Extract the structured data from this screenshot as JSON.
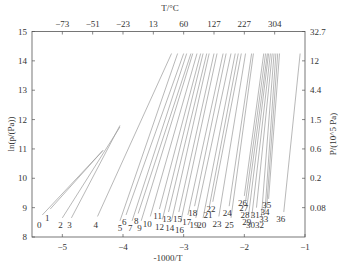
{
  "chart_data": {
    "type": "line",
    "title": "",
    "xlabel": "-1000/T",
    "ylabel": "ln(p/(Pa))",
    "top_xlabel": "T/°C",
    "right_ylabel": "P/(10^5 Pa)",
    "xlim": [
      -5.5,
      -1
    ],
    "ylim": [
      8,
      15
    ],
    "grid": false,
    "legend": "none (series labeled 0–36 at lower ends)",
    "x_ticks": [
      -5,
      -4,
      -3,
      -2,
      -1
    ],
    "x_tick_labels": [
      "−5",
      "−4",
      "−3",
      "−2",
      "−1"
    ],
    "y_ticks": [
      8,
      9,
      10,
      11,
      12,
      13,
      14,
      15
    ],
    "y_tick_labels": [
      "8",
      "9",
      "10",
      "11",
      "12",
      "13",
      "14",
      "15"
    ],
    "top_ticks": [
      -5,
      -4.5,
      -4,
      -3.5,
      -3,
      -2.5,
      -2,
      -1.5
    ],
    "top_tick_labels": [
      "−73",
      "−51",
      "−23",
      "13",
      "60",
      "127",
      "227",
      "304"
    ],
    "right_ticks": [
      9,
      10,
      11,
      12,
      13,
      14,
      15
    ],
    "right_tick_labels": [
      "0.08",
      "0.2",
      "0.6",
      "1.5",
      "4.4",
      "12",
      "32.7"
    ],
    "series": [
      {
        "name": "0",
        "x": [
          -5.33,
          -4.33
        ],
        "y": [
          8.75,
          10.95
        ],
        "label_at": [
          -5.38,
          8.3
        ]
      },
      {
        "name": "1",
        "x": [
          -5.2,
          -4.33
        ],
        "y": [
          8.95,
          10.95
        ],
        "label_at": [
          -5.25,
          8.55
        ]
      },
      {
        "name": "2",
        "x": [
          -5.0,
          -4.05
        ],
        "y": [
          8.65,
          11.75
        ],
        "label_at": [
          -5.03,
          8.3
        ]
      },
      {
        "name": "3",
        "x": [
          -4.85,
          -4.05
        ],
        "y": [
          8.65,
          11.8
        ],
        "label_at": [
          -4.88,
          8.3
        ]
      },
      {
        "name": "4",
        "x": [
          -4.42,
          -3.2
        ],
        "y": [
          8.7,
          14.25
        ],
        "label_at": [
          -4.45,
          8.3
        ]
      },
      {
        "name": "5",
        "x": [
          -4.05,
          -3.1
        ],
        "y": [
          8.55,
          14.25
        ],
        "label_at": [
          -4.05,
          8.2
        ]
      },
      {
        "name": "6",
        "x": [
          -3.95,
          -3.0
        ],
        "y": [
          8.75,
          14.25
        ],
        "label_at": [
          -3.98,
          8.4
        ]
      },
      {
        "name": "7",
        "x": [
          -3.85,
          -2.95
        ],
        "y": [
          8.55,
          14.25
        ],
        "label_at": [
          -3.88,
          8.2
        ]
      },
      {
        "name": "8",
        "x": [
          -3.75,
          -2.88
        ],
        "y": [
          8.8,
          14.25
        ],
        "label_at": [
          -3.78,
          8.45
        ]
      },
      {
        "name": "9",
        "x": [
          -3.7,
          -2.85
        ],
        "y": [
          8.55,
          14.25
        ],
        "label_at": [
          -3.73,
          8.2
        ]
      },
      {
        "name": "10",
        "x": [
          -3.55,
          -2.78
        ],
        "y": [
          8.7,
          14.25
        ],
        "label_at": [
          -3.6,
          8.35
        ]
      },
      {
        "name": "11",
        "x": [
          -3.4,
          -2.72
        ],
        "y": [
          8.95,
          14.25
        ],
        "label_at": [
          -3.43,
          8.6
        ]
      },
      {
        "name": "12",
        "x": [
          -3.35,
          -2.68
        ],
        "y": [
          8.6,
          14.25
        ],
        "label_at": [
          -3.4,
          8.25
        ]
      },
      {
        "name": "13",
        "x": [
          -3.25,
          -2.62
        ],
        "y": [
          8.85,
          14.25
        ],
        "label_at": [
          -3.28,
          8.5
        ]
      },
      {
        "name": "14",
        "x": [
          -3.2,
          -2.58
        ],
        "y": [
          8.55,
          14.25
        ],
        "label_at": [
          -3.23,
          8.2
        ]
      },
      {
        "name": "15",
        "x": [
          -3.08,
          -2.5
        ],
        "y": [
          8.85,
          14.25
        ],
        "label_at": [
          -3.1,
          8.5
        ]
      },
      {
        "name": "16",
        "x": [
          -3.05,
          -2.45
        ],
        "y": [
          8.5,
          14.25
        ],
        "label_at": [
          -3.07,
          8.15
        ]
      },
      {
        "name": "17",
        "x": [
          -2.93,
          -2.35
        ],
        "y": [
          8.75,
          14.25
        ],
        "label_at": [
          -2.95,
          8.4
        ]
      },
      {
        "name": "18",
        "x": [
          -2.82,
          -2.3
        ],
        "y": [
          9.05,
          14.25
        ],
        "label_at": [
          -2.85,
          8.7
        ]
      },
      {
        "name": "19",
        "x": [
          -2.8,
          -2.22
        ],
        "y": [
          8.65,
          14.25
        ],
        "label_at": [
          -2.83,
          8.3
        ]
      },
      {
        "name": "20",
        "x": [
          -2.68,
          -2.15
        ],
        "y": [
          8.65,
          14.25
        ],
        "label_at": [
          -2.7,
          8.3
        ]
      },
      {
        "name": "21",
        "x": [
          -2.58,
          -2.1
        ],
        "y": [
          9.0,
          14.25
        ],
        "label_at": [
          -2.6,
          8.65
        ]
      },
      {
        "name": "22",
        "x": [
          -2.52,
          -2.05
        ],
        "y": [
          9.2,
          14.25
        ],
        "label_at": [
          -2.55,
          8.85
        ]
      },
      {
        "name": "23",
        "x": [
          -2.42,
          -1.98
        ],
        "y": [
          8.7,
          14.25
        ],
        "label_at": [
          -2.45,
          8.35
        ]
      },
      {
        "name": "24",
        "x": [
          -2.25,
          -1.88
        ],
        "y": [
          9.05,
          14.25
        ],
        "label_at": [
          -2.28,
          8.7
        ]
      },
      {
        "name": "25",
        "x": [
          -2.22,
          -1.85
        ],
        "y": [
          8.65,
          14.25
        ],
        "label_at": [
          -2.25,
          8.3
        ]
      },
      {
        "name": "26",
        "x": [
          -2.0,
          -1.68
        ],
        "y": [
          9.4,
          14.25
        ],
        "label_at": [
          -2.03,
          9.05
        ]
      },
      {
        "name": "27",
        "x": [
          -1.98,
          -1.65
        ],
        "y": [
          9.2,
          14.25
        ],
        "label_at": [
          -2.01,
          8.9
        ]
      },
      {
        "name": "28",
        "x": [
          -1.96,
          -1.62
        ],
        "y": [
          9.0,
          14.25
        ],
        "label_at": [
          -1.99,
          8.65
        ]
      },
      {
        "name": "29",
        "x": [
          -1.93,
          -1.6
        ],
        "y": [
          8.75,
          14.25
        ],
        "label_at": [
          -1.96,
          8.4
        ]
      },
      {
        "name": "30",
        "x": [
          -1.88,
          -1.57
        ],
        "y": [
          8.65,
          14.25
        ],
        "label_at": [
          -1.9,
          8.3
        ]
      },
      {
        "name": "31",
        "x": [
          -1.8,
          -1.54
        ],
        "y": [
          9.0,
          14.25
        ],
        "label_at": [
          -1.82,
          8.65
        ]
      },
      {
        "name": "32",
        "x": [
          -1.72,
          -1.51
        ],
        "y": [
          8.65,
          14.25
        ],
        "label_at": [
          -1.75,
          8.3
        ]
      },
      {
        "name": "33",
        "x": [
          -1.66,
          -1.48
        ],
        "y": [
          8.85,
          14.25
        ],
        "label_at": [
          -1.68,
          8.5
        ]
      },
      {
        "name": "34",
        "x": [
          -1.63,
          -1.45
        ],
        "y": [
          9.05,
          14.25
        ],
        "label_at": [
          -1.66,
          8.75
        ]
      },
      {
        "name": "35",
        "x": [
          -1.6,
          -1.42
        ],
        "y": [
          9.3,
          14.25
        ],
        "label_at": [
          -1.63,
          9.0
        ]
      },
      {
        "name": "36",
        "x": [
          -1.35,
          -1.08
        ],
        "y": [
          8.85,
          14.25
        ],
        "label_at": [
          -1.4,
          8.5
        ]
      }
    ]
  }
}
